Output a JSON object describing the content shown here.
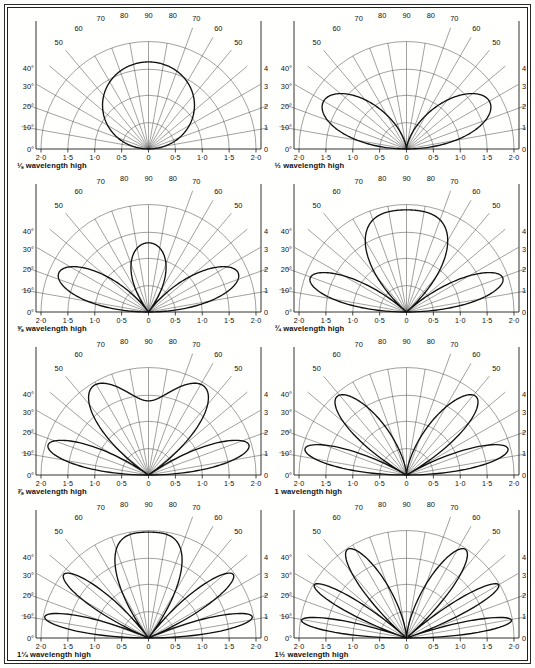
{
  "page": {
    "background_color": "#fdfdfb",
    "line_color": "#1b1b1b",
    "grid_color": "#4a4a4a"
  },
  "axes": {
    "x_tick_labels": [
      "2·0",
      "1·5",
      "1·0",
      "0·5",
      "0",
      "0·5",
      "1·0",
      "1·5",
      "2·0"
    ],
    "x_tick_values": [
      -2.0,
      -1.5,
      -1.0,
      -0.5,
      0,
      0.5,
      1.0,
      1.5,
      2.0
    ],
    "top_angle_labels": [
      "50",
      "60",
      "70",
      "80",
      "90",
      "80",
      "70",
      "60",
      "50"
    ],
    "top_angle_values": [
      50,
      60,
      70,
      80,
      90,
      80,
      70,
      60,
      50
    ],
    "left_angle_labels": [
      "40°",
      "30°",
      "20°",
      "10°",
      "0°"
    ],
    "right_angle_labels": [
      "40°",
      "30°",
      "20°",
      "10°",
      "0°"
    ],
    "right_angle_labels_plain": [
      "40",
      "30",
      "20",
      "10",
      "0"
    ],
    "angle_values": [
      40,
      30,
      20,
      10,
      0
    ],
    "radial_grid_angles": [
      0,
      10,
      20,
      30,
      40,
      50,
      60,
      70,
      80,
      90,
      100,
      110,
      120,
      130,
      140,
      150,
      160,
      170,
      180
    ],
    "arc_radii": [
      0.5,
      1.0,
      1.5,
      2.0
    ],
    "xlim": [
      -2.0,
      2.0
    ],
    "ylim": [
      0,
      2.0
    ]
  },
  "chart_data": {
    "type": "line",
    "xlabel": "",
    "ylabel": "",
    "xlim": [
      -2.0,
      2.0
    ],
    "ylim": [
      0,
      2.0
    ],
    "grid": true,
    "legend": "none",
    "plot_kind": "polar-half-plane",
    "angle_axis_labels": [
      "0°",
      "10°",
      "20°",
      "30°",
      "40°",
      "50",
      "60",
      "70",
      "80",
      "90"
    ],
    "radius_axis_labels": [
      "0",
      "0·5",
      "1·0",
      "1·5",
      "2·0"
    ],
    "panels": [
      {
        "index": 1,
        "caption": "⅛ wavelength high",
        "height_wavelengths": 0.125,
        "height_label": "1/8",
        "lobe_count_per_side": 1,
        "max_radius": 1.62,
        "peak_elevation_deg": 90,
        "right_labels_have_degree_symbol": true
      },
      {
        "index": 2,
        "caption": "½ wavelength high",
        "height_wavelengths": 0.5,
        "height_label": "1/2",
        "lobe_count_per_side": 1,
        "max_radius": 1.78,
        "peak_elevation_deg": 28,
        "right_labels_have_degree_symbol": false
      },
      {
        "index": 3,
        "caption": "⅝ wavelength high",
        "height_wavelengths": 0.625,
        "height_label": "5/8",
        "lobe_count_per_side": 2,
        "max_radius": 1.82,
        "peak_elevation_deg": 22,
        "right_labels_have_degree_symbol": true
      },
      {
        "index": 4,
        "caption": "¾ wavelength high",
        "height_wavelengths": 0.75,
        "height_label": "3/4",
        "lobe_count_per_side": 2,
        "max_radius": 1.9,
        "peak_elevation_deg": 19,
        "right_labels_have_degree_symbol": true
      },
      {
        "index": 5,
        "caption": "⅞ wavelength high",
        "height_wavelengths": 0.875,
        "height_label": "7/8",
        "lobe_count_per_side": 2,
        "max_radius": 1.95,
        "peak_elevation_deg": 16,
        "right_labels_have_degree_symbol": true
      },
      {
        "index": 6,
        "caption": "1 wavelength high",
        "height_wavelengths": 1.0,
        "height_label": "1",
        "lobe_count_per_side": 2,
        "max_radius": 1.95,
        "peak_elevation_deg": 15,
        "right_labels_have_degree_symbol": true
      },
      {
        "index": 7,
        "caption": "1¼ wavelength high",
        "height_wavelengths": 1.25,
        "height_label": "1 1/4",
        "lobe_count_per_side": 3,
        "max_radius": 1.97,
        "peak_elevation_deg": 12,
        "right_labels_have_degree_symbol": true
      },
      {
        "index": 8,
        "caption": "1½ wavelength high",
        "height_wavelengths": 1.5,
        "height_label": "1 1/2",
        "lobe_count_per_side": 3,
        "max_radius": 1.98,
        "peak_elevation_deg": 10,
        "right_labels_have_degree_symbol": true
      }
    ]
  }
}
